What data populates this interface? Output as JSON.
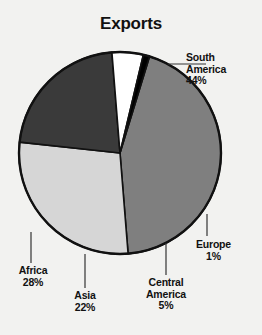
{
  "chart": {
    "title": "Exports"
  },
  "chart_data": {
    "type": "pie",
    "title": "Exports",
    "xlabel": "",
    "ylabel": "",
    "unit": "%",
    "legend_position": "callout-labels",
    "grid": false,
    "categories": [
      "South America",
      "Africa",
      "Asia",
      "Central America",
      "Europe"
    ],
    "values": [
      44,
      28,
      22,
      5,
      1
    ],
    "labels": [
      "44%",
      "28%",
      "22%",
      "5%",
      "1%"
    ],
    "colors": [
      "#7f7f7f",
      "#d6d6d6",
      "#3a3a3a",
      "#ffffff",
      "#000000"
    ],
    "slices": [
      {
        "name": "South America",
        "value": 44,
        "label": "44%",
        "color": "#7f7f7f"
      },
      {
        "name": "Africa",
        "value": 28,
        "label": "28%",
        "color": "#d6d6d6"
      },
      {
        "name": "Asia",
        "value": 22,
        "label": "22%",
        "color": "#3a3a3a"
      },
      {
        "name": "Central America",
        "value": 5,
        "label": "5%",
        "color": "#ffffff"
      },
      {
        "name": "Europe",
        "value": 1,
        "label": "1%",
        "color": "#000000"
      }
    ]
  },
  "labels": {
    "south_america": {
      "line1": "South",
      "line2": "America",
      "pct": "44%"
    },
    "europe": {
      "line1": "Europe",
      "pct": "1%"
    },
    "central_america": {
      "line1": "Central",
      "line2": "America",
      "pct": "5%"
    },
    "asia": {
      "line1": "Asia",
      "pct": "22%"
    },
    "africa": {
      "line1": "Africa",
      "pct": "28%"
    }
  }
}
